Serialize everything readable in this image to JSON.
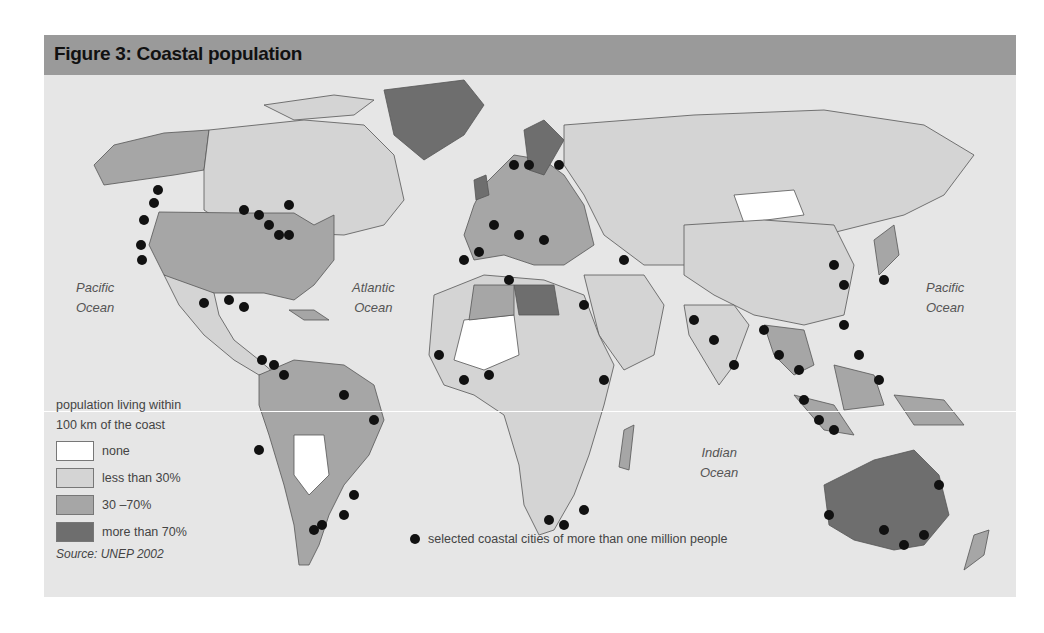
{
  "figure": {
    "title": "Figure 3: Coastal population",
    "source": "Source: UNEP 2002"
  },
  "oceans": [
    {
      "name": "Pacific Ocean",
      "line1": "Pacific",
      "line2": "Ocean"
    },
    {
      "name": "Atlantic Ocean",
      "line1": "Atlantic",
      "line2": "Ocean"
    },
    {
      "name": "Indian Ocean",
      "line1": "Indian",
      "line2": "Ocean"
    },
    {
      "name": "Pacific Ocean (east)",
      "line1": "Pacific",
      "line2": "Ocean"
    }
  ],
  "legend": {
    "title_line1": "population living within",
    "title_line2": "100 km of the coast",
    "items": [
      {
        "label": "none",
        "color": "#ffffff"
      },
      {
        "label": "less than 30%",
        "color": "#d4d4d4"
      },
      {
        "label": "30 –70%",
        "color": "#a6a6a6"
      },
      {
        "label": "more than 70%",
        "color": "#6e6e6e"
      }
    ],
    "cities_label": "selected coastal cities of more than one million people"
  },
  "colors": {
    "background": "#e6e6e6",
    "header": "#9a9a9a",
    "city_dot": "#111111"
  }
}
